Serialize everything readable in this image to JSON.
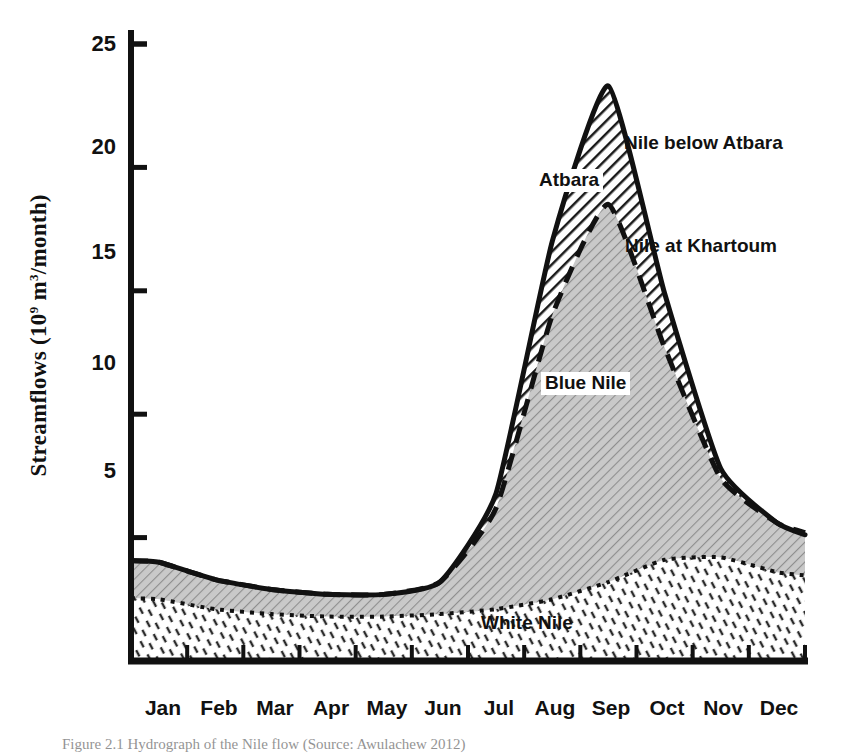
{
  "figure": {
    "caption": "Figure 2.1  Hydrograph of the Nile flow (Source: Awulachew 2012)"
  },
  "chart_data": {
    "type": "area",
    "title": "",
    "subtitle": "",
    "xlabel": "",
    "ylabel": "Streamflows (10⁹ m³/month)",
    "ylabel_parts": {
      "main": "Streamflows  (10",
      "sup1": "9",
      "mid": " m",
      "sup2": "3",
      "tail": "/month)"
    },
    "grid": false,
    "legend_position": "inline-annotations",
    "stacked": true,
    "xlim": [
      0,
      12
    ],
    "ylim": [
      0,
      25
    ],
    "yticks": [
      5,
      10,
      15,
      20,
      25
    ],
    "ytick_labels": [
      "5",
      "10",
      "15",
      "20",
      "25"
    ],
    "categories": [
      "Jan",
      "Feb",
      "Mar",
      "Apr",
      "May",
      "Jun",
      "Jul",
      "Aug",
      "Sep",
      "Oct",
      "Nov",
      "Dec"
    ],
    "units": "10^9 m^3/month",
    "series": [
      {
        "name": "White Nile",
        "label": "White Nile",
        "line_style": "dotted",
        "fill": "sparse-diagonal-dashes",
        "cumulative": false,
        "values": [
          2.5,
          2.1,
          1.9,
          1.8,
          1.8,
          1.9,
          2.1,
          2.5,
          3.2,
          4.1,
          4.2,
          3.6
        ]
      },
      {
        "name": "Blue Nile",
        "label": "Blue Nile",
        "line_style": "dashed",
        "fill": "light-gray-fine-hatch",
        "cumulative_name": "Nile at Khartoum",
        "cumulative_label": "Nile at Khartoum",
        "values": [
          1.5,
          1.2,
          1.0,
          0.9,
          0.9,
          1.3,
          4.1,
          11.5,
          15.3,
          8.6,
          3.2,
          2.0
        ],
        "cumulative_values": [
          4.0,
          3.3,
          2.9,
          2.7,
          2.7,
          3.2,
          6.2,
          14.0,
          18.5,
          12.7,
          7.4,
          5.6
        ]
      },
      {
        "name": "Atbara",
        "label": "Atbara",
        "line_style": "solid",
        "fill": "dark-diagonal-hatch",
        "cumulative_name": "Nile below Atbara",
        "cumulative_label": "Nile below Atbara",
        "values": [
          0.0,
          0.0,
          0.0,
          0.0,
          0.0,
          0.0,
          0.6,
          3.0,
          4.8,
          2.2,
          0.4,
          0.0
        ],
        "cumulative_values": [
          4.0,
          3.3,
          2.9,
          2.7,
          2.7,
          3.2,
          6.8,
          17.0,
          23.3,
          14.9,
          7.8,
          5.6
        ]
      }
    ],
    "annotations": [
      {
        "text": "Nile below Atbara",
        "anchor": "upper-right-of-peak"
      },
      {
        "text": "Atbara",
        "anchor": "inside-peak-band"
      },
      {
        "text": "Nile at Khartoum",
        "anchor": "right-of-inner-peak"
      },
      {
        "text": "Blue Nile",
        "anchor": "inside-blue-nile-area"
      },
      {
        "text": "White Nile",
        "anchor": "inside-white-nile-area"
      }
    ],
    "peak_month": "Sep",
    "peak_value_nile_below_atbara": 23.3,
    "peak_value_nile_at_khartoum": 18.5,
    "peak_value_white_nile": 4.2
  },
  "colors": {
    "ink": "#111111",
    "blue_nile_fill": "#c9c9c9",
    "atbara_fill": "#3a3a3a",
    "white_nile_fill": "#ffffff",
    "background": "#ffffff"
  }
}
